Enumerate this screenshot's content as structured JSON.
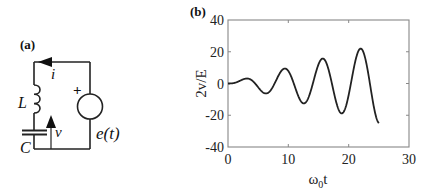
{
  "panel_a": {
    "label": "(a)",
    "components": {
      "current_label": "i",
      "inductor_label": "L",
      "capacitor_label": "C",
      "voltage_label": "v",
      "source_label": "e(t)",
      "source_polarity": "+"
    }
  },
  "panel_b": {
    "label": "(b)"
  },
  "chart_data": {
    "type": "line",
    "title": "",
    "panel_label": "(b)",
    "xlabel": "ω0t",
    "ylabel": "2v/E",
    "xlim": [
      0,
      30
    ],
    "ylim": [
      -40,
      40
    ],
    "xticks": [
      0,
      10,
      20,
      30
    ],
    "yticks": [
      -40,
      -20,
      0,
      20,
      40
    ],
    "x_tick_labels": [
      "0",
      "10",
      "20",
      "30"
    ],
    "y_tick_labels": [
      "-40",
      "-20",
      "0",
      "20",
      "40"
    ],
    "grid": false,
    "legend": null,
    "series": [
      {
        "name": "2v/E",
        "formula_approx": "sin(x) - x*cos(x)",
        "x_range": [
          0,
          25
        ],
        "extrema": [
          {
            "x": 0,
            "y": 0
          },
          {
            "x": 3.2,
            "y": 3.1
          },
          {
            "x": 6.3,
            "y": -6.3
          },
          {
            "x": 9.4,
            "y": 9.4
          },
          {
            "x": 12.6,
            "y": -12.6
          },
          {
            "x": 15.7,
            "y": 15.7
          },
          {
            "x": 18.8,
            "y": -18.8
          },
          {
            "x": 22.0,
            "y": 22.0
          },
          {
            "x": 25.0,
            "y": -24.9
          }
        ]
      }
    ]
  }
}
